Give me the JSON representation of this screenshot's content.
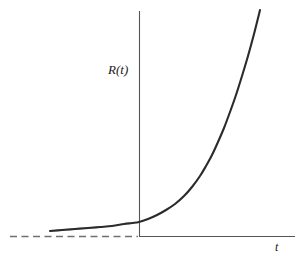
{
  "figure": {
    "width": 305,
    "height": 260,
    "background": "#ffffff"
  },
  "labels": {
    "ylabel": "R(t)",
    "xlabel": "t"
  },
  "colors": {
    "curve": "#2b2b2b",
    "axis": "#555555",
    "dashed": "#707070",
    "text": "#1a1a1a",
    "background": "#ffffff"
  },
  "chart_data": {
    "type": "line",
    "title": "",
    "xlabel": "t",
    "ylabel": "R(t)",
    "grid": false,
    "legend": false,
    "axes": {
      "origin_px": [
        139,
        236
      ],
      "y_axis_top_px": [
        139,
        11
      ],
      "x_axis_right_px": [
        295,
        236
      ],
      "ticks": [],
      "tick_labels": []
    },
    "annotations": [
      {
        "name": "asymptote",
        "style": "dashed",
        "description": "horizontal dashed asymptote at R = 0 extending left of the vertical axis",
        "from_px": [
          10,
          236
        ],
        "to_px": [
          139,
          236
        ]
      }
    ],
    "series": [
      {
        "name": "R(t)",
        "style": "solid",
        "description": "exponential growth curve, flat asymptotic tail on the left rising steeply to the upper right",
        "points_px": [
          [
            50,
            231
          ],
          [
            62,
            230
          ],
          [
            75,
            229
          ],
          [
            88,
            228
          ],
          [
            100,
            227
          ],
          [
            112,
            226
          ],
          [
            124,
            224
          ],
          [
            132,
            223
          ],
          [
            139,
            222
          ],
          [
            148,
            219
          ],
          [
            157,
            215
          ],
          [
            166,
            210
          ],
          [
            175,
            204
          ],
          [
            184,
            196
          ],
          [
            192,
            187
          ],
          [
            200,
            176
          ],
          [
            206,
            166
          ],
          [
            212,
            155
          ],
          [
            218,
            142
          ],
          [
            224,
            128
          ],
          [
            230,
            112
          ],
          [
            236,
            95
          ],
          [
            242,
            76
          ],
          [
            248,
            56
          ],
          [
            254,
            34
          ],
          [
            260,
            10
          ]
        ]
      }
    ]
  }
}
